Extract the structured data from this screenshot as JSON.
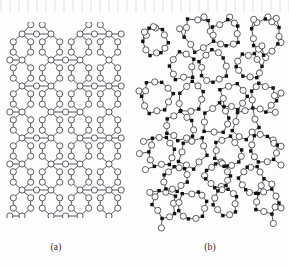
{
  "figure": {
    "background_color": "#fdfdfd",
    "bond_color": "#555560",
    "oxygen_fill": "#ffffff",
    "oxygen_stroke": "#4a4a52",
    "silicon_fill": "#111111",
    "oxygen_radius": 3.1,
    "silicon_radius": 1.7,
    "bond_width": 1.0,
    "node_stroke_width": 0.9
  },
  "panels": [
    {
      "id": "a",
      "caption": "(a)",
      "kind": "crystalline",
      "atom_legend": [
        "oxygen-open-circle"
      ],
      "description": "regular periodic lattice of open circles",
      "lattice": {
        "columns": 4,
        "rows": 7,
        "cell_width": 29,
        "cell_height": 26,
        "origin_x": 16,
        "origin_y": 12
      }
    },
    {
      "id": "b",
      "caption": "(b)",
      "kind": "amorphous",
      "atom_legend": [
        "oxygen-open-circle",
        "silicon-filled-dot"
      ],
      "description": "irregular random network of open circles and filled dots",
      "rings": 18
    }
  ],
  "chart_data": {
    "type": "diagram",
    "panels": [
      {
        "label": "(a)",
        "structure": "crystalline",
        "node_types": [
          "open circle"
        ],
        "ring_regularity": "uniform hexagonal rings"
      },
      {
        "label": "(b)",
        "structure": "amorphous",
        "node_types": [
          "open circle",
          "filled dot"
        ],
        "ring_regularity": "irregular rings of varied size"
      }
    ]
  }
}
